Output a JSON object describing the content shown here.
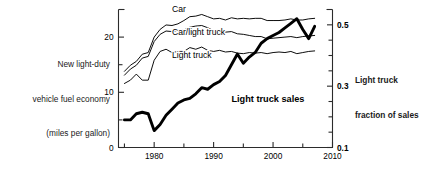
{
  "left_caption": {
    "lines": [
      "New light-duty",
      "vehicle fuel economy",
      "(miles per gallon)"
    ]
  },
  "right_caption": {
    "lines": [
      "Light truck",
      "fraction of sales"
    ]
  },
  "colors": {
    "axis": "#2b2b2b",
    "curve_thin": "#000000",
    "curve_thick": "#000000",
    "background": "#ffffff"
  },
  "chart_data": {
    "type": "line",
    "title": "",
    "subtitle": "",
    "xlabel": "",
    "ylabel": "New light-duty vehicle fuel economy (miles per gallon)",
    "y2label": "Light truck fraction of sales",
    "grid": false,
    "legend_position": "inline-labels",
    "xlim": [
      1974,
      2010
    ],
    "ylim": [
      0,
      25
    ],
    "y2lim": [
      0.1,
      0.55
    ],
    "x_ticks_major": [
      1980,
      1990,
      2000,
      2010
    ],
    "x_ticks_minor": [
      1975,
      1985,
      1995,
      2005
    ],
    "x_tick_labels": [
      "1980",
      "1990",
      "2000",
      "2010"
    ],
    "y_ticks_major": [
      0,
      10,
      20
    ],
    "y_ticks_minor": [
      5,
      15
    ],
    "y_tick_labels": [
      "0",
      "10",
      "20"
    ],
    "y2_ticks_major": [
      0.1,
      0.3,
      0.5
    ],
    "y2_ticks_minor": [
      0.15,
      0.2,
      0.25,
      0.35,
      0.4,
      0.45
    ],
    "y2_tick_labels": [
      "0.1",
      "0.3",
      "0.5"
    ],
    "series": [
      {
        "name": "Car",
        "label": "Car",
        "axis": "left",
        "style": "thin",
        "units": "miles per gallon",
        "x": [
          1975,
          1976,
          1977,
          1978,
          1979,
          1980,
          1981,
          1982,
          1983,
          1984,
          1985,
          1986,
          1987,
          1988,
          1989,
          1990,
          1991,
          1992,
          1993,
          1994,
          1995,
          1996,
          1997,
          1998,
          1999,
          2000,
          2001,
          2002,
          2003,
          2004,
          2005,
          2006,
          2007
        ],
        "values": [
          13.8,
          14.9,
          15.6,
          16.9,
          17.2,
          20.0,
          21.4,
          22.2,
          22.1,
          22.4,
          23.0,
          23.7,
          23.8,
          24.1,
          23.7,
          23.3,
          23.4,
          23.1,
          23.5,
          23.3,
          23.4,
          23.3,
          23.4,
          23.4,
          23.0,
          23.0,
          23.0,
          23.1,
          23.3,
          23.1,
          23.1,
          23.3,
          23.4
        ]
      },
      {
        "name": "Car/light truck",
        "label": "Car/light truck",
        "axis": "left",
        "style": "thin",
        "units": "miles per gallon",
        "x": [
          1975,
          1976,
          1977,
          1978,
          1979,
          1980,
          1981,
          1982,
          1983,
          1984,
          1985,
          1986,
          1987,
          1988,
          1989,
          1990,
          1991,
          1992,
          1993,
          1994,
          1995,
          1996,
          1997,
          1998,
          1999,
          2000,
          2001,
          2002,
          2003,
          2004,
          2005,
          2006,
          2007
        ],
        "values": [
          13.1,
          14.2,
          14.9,
          16.2,
          16.5,
          19.2,
          20.5,
          21.1,
          21.0,
          21.2,
          21.3,
          21.8,
          22.0,
          22.1,
          21.7,
          21.2,
          21.3,
          20.9,
          21.0,
          20.6,
          20.5,
          20.3,
          20.1,
          20.1,
          19.7,
          19.8,
          19.9,
          20.0,
          20.1,
          19.9,
          20.1,
          20.2,
          20.3
        ]
      },
      {
        "name": "Light truck",
        "label": "Light truck",
        "axis": "left",
        "style": "thin",
        "units": "miles per gallon",
        "x": [
          1975,
          1976,
          1977,
          1978,
          1979,
          1980,
          1981,
          1982,
          1983,
          1984,
          1985,
          1986,
          1987,
          1988,
          1989,
          1990,
          1991,
          1992,
          1993,
          1994,
          1995,
          1996,
          1997,
          1998,
          1999,
          2000,
          2001,
          2002,
          2003,
          2004,
          2005,
          2006,
          2007
        ],
        "values": [
          11.6,
          12.2,
          13.3,
          12.2,
          12.2,
          15.8,
          17.4,
          17.8,
          17.2,
          17.4,
          17.4,
          18.1,
          17.8,
          18.2,
          17.6,
          17.4,
          17.6,
          17.3,
          17.4,
          17.1,
          17.0,
          17.2,
          17.1,
          17.2,
          17.0,
          17.2,
          17.3,
          17.2,
          17.4,
          17.0,
          17.2,
          17.4,
          17.5
        ]
      },
      {
        "name": "Light truck sales",
        "label": "Light truck sales",
        "axis": "right",
        "style": "thick",
        "units": "fraction of sales",
        "x": [
          1975,
          1976,
          1977,
          1978,
          1979,
          1980,
          1981,
          1982,
          1983,
          1984,
          1985,
          1986,
          1987,
          1988,
          1989,
          1990,
          1991,
          1992,
          1993,
          1994,
          1995,
          1996,
          1997,
          1998,
          1999,
          2000,
          2001,
          2002,
          2003,
          2004,
          2005,
          2006,
          2007
        ],
        "values": [
          0.19,
          0.19,
          0.21,
          0.215,
          0.21,
          0.155,
          0.175,
          0.205,
          0.225,
          0.245,
          0.255,
          0.26,
          0.275,
          0.295,
          0.29,
          0.305,
          0.315,
          0.335,
          0.37,
          0.405,
          0.375,
          0.395,
          0.41,
          0.44,
          0.455,
          0.465,
          0.475,
          0.49,
          0.505,
          0.52,
          0.485,
          0.455,
          0.495
        ]
      }
    ],
    "curve_labels": [
      {
        "text": "Car",
        "x": 1983,
        "y": 24.6,
        "style": "thin"
      },
      {
        "text": "Car/light truck",
        "x": 1983,
        "y": 20.3,
        "style": "thin"
      },
      {
        "text": "Light truck",
        "x": 1983,
        "y": 16.3,
        "style": "thin"
      },
      {
        "text": "Light truck sales",
        "x": 1993,
        "y": 8.2,
        "style": "bold"
      }
    ]
  }
}
